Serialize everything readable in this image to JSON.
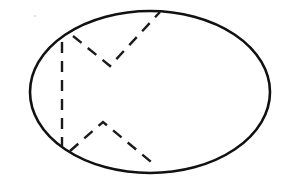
{
  "diagram": {
    "background": "#ffffff",
    "stroke_color": "#111111",
    "ellipse": {
      "cx": 150,
      "cy": 92,
      "rx": 120,
      "ry": 81
    },
    "dashed_lines": [
      {
        "name": "vertical-dashed-chord",
        "points": "62,42 62,146"
      },
      {
        "name": "upper-v-dashed-path",
        "points": "73,36 110,66 160,12"
      },
      {
        "name": "lower-caret-dashed-path",
        "points": "70,151 103,122 156,166"
      }
    ],
    "specks": [
      {
        "cx": 35,
        "cy": 16,
        "r": 0.8
      }
    ]
  }
}
